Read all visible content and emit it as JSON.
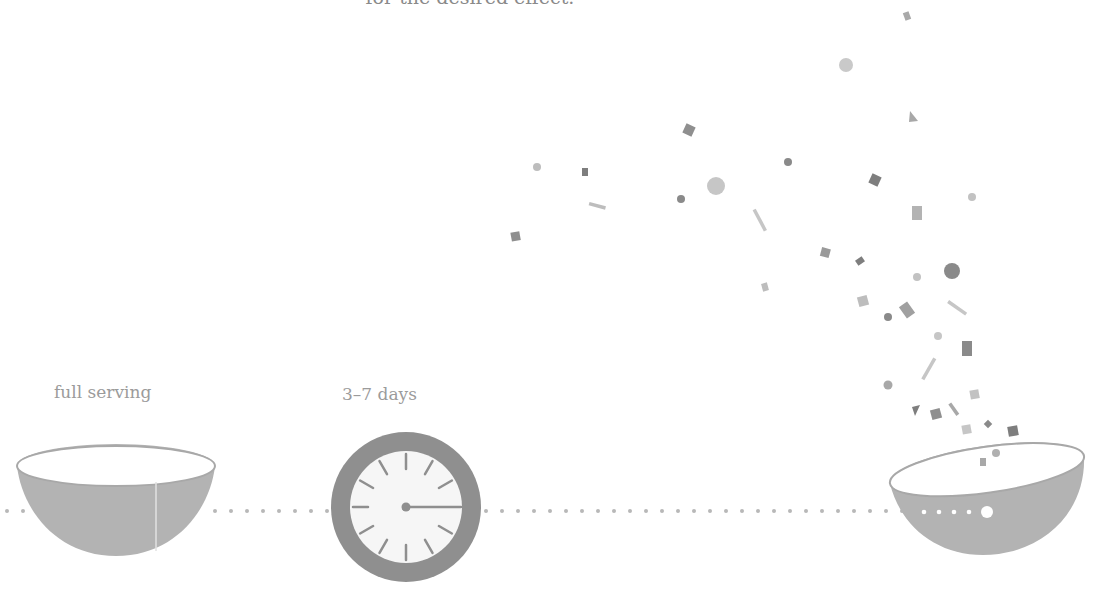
{
  "heading": {
    "text": "for the desired effect."
  },
  "stages": [
    {
      "id": "start",
      "label": "full serving",
      "icon": "full-bowl-icon"
    },
    {
      "id": "wait",
      "label": "3–7 days",
      "icon": "clock-icon"
    },
    {
      "id": "end",
      "label": "",
      "icon": "bowl-with-confetti-icon"
    }
  ],
  "colors": {
    "bowl_fill": "#b3b3b3",
    "clock_ring": "#8f8f8f",
    "clock_face": "#f6f6f6",
    "dots": "#b8b8b8",
    "confetti_dark": "#7e7e7e",
    "confetti_mid": "#a3a3a3",
    "confetti_light": "#c6c6c6",
    "text": "#9b9b9b"
  }
}
